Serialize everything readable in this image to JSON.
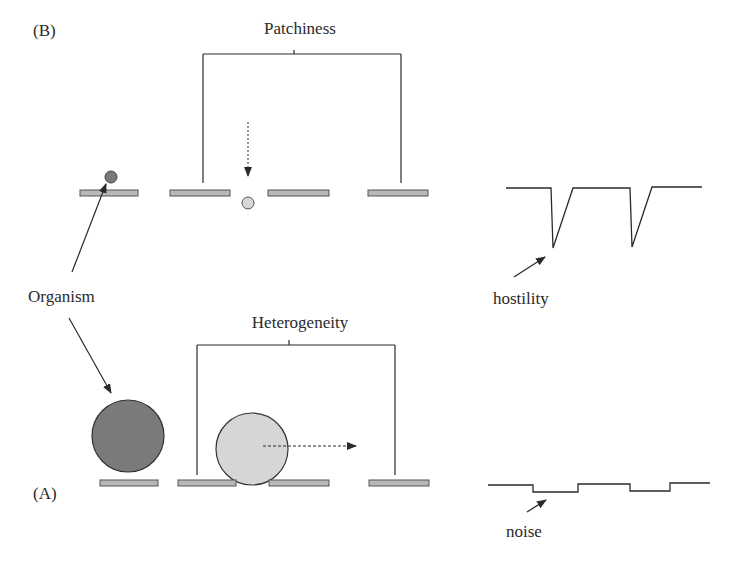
{
  "panel_b": {
    "label": "(B)",
    "title": "Patchiness",
    "trace_label": "hostility"
  },
  "panel_a": {
    "label": "(A)",
    "title": "Heterogeneity",
    "trace_label": "noise"
  },
  "shared": {
    "organism_label": "Organism"
  },
  "colors": {
    "line": "#2a2a2a",
    "patch_fill": "#b8b8b8",
    "organism_dark": "#7a7a7a",
    "organism_light": "#d6d6d6"
  }
}
